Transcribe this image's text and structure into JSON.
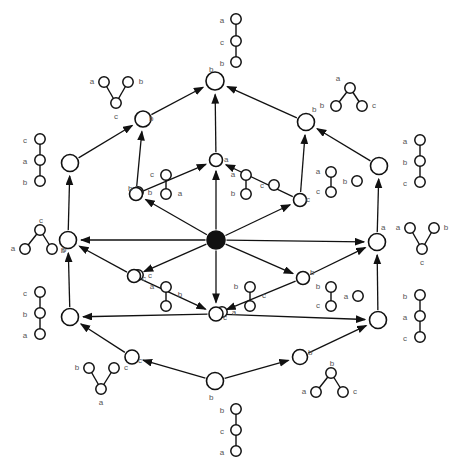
{
  "diagram": {
    "type": "lattice-diagram",
    "node_color": "#ffffff",
    "node_stroke": "#111111",
    "bottom_node_color": "#111111",
    "edge_color": "#111111",
    "label_color": "#555555",
    "labels": {
      "a": "a",
      "b": "b",
      "c": "c"
    },
    "lattice_nodes": [
      {
        "id": "top",
        "x": 215,
        "y": 81,
        "r": 9,
        "filled": false,
        "name": "lattice-node-top"
      },
      {
        "id": "ul",
        "x": 143,
        "y": 119,
        "r": 8,
        "filled": false,
        "name": "lattice-node-upper-left"
      },
      {
        "id": "ur",
        "x": 306,
        "y": 122,
        "r": 8.5,
        "filled": false,
        "name": "lattice-node-upper-right"
      },
      {
        "id": "l1",
        "x": 70,
        "y": 163,
        "r": 8.5,
        "filled": false,
        "name": "lattice-node-left-upper"
      },
      {
        "id": "m1",
        "x": 216,
        "y": 160,
        "r": 6.5,
        "filled": false,
        "name": "lattice-node-inner-top"
      },
      {
        "id": "r1",
        "x": 379,
        "y": 166,
        "r": 8.5,
        "filled": false,
        "name": "lattice-node-right-upper"
      },
      {
        "id": "im_l",
        "x": 136,
        "y": 194,
        "r": 6.5,
        "filled": false,
        "name": "lattice-node-inner-upper-left"
      },
      {
        "id": "im_r",
        "x": 300,
        "y": 200,
        "r": 6.5,
        "filled": false,
        "name": "lattice-node-inner-upper-right"
      },
      {
        "id": "l2",
        "x": 68,
        "y": 240,
        "r": 8.5,
        "filled": false,
        "name": "lattice-node-left-lower"
      },
      {
        "id": "center",
        "x": 216,
        "y": 240,
        "r": 9,
        "filled": true,
        "name": "lattice-node-center"
      },
      {
        "id": "r2",
        "x": 377,
        "y": 242,
        "r": 8.5,
        "filled": false,
        "name": "lattice-node-right-lower"
      },
      {
        "id": "im_l2",
        "x": 134,
        "y": 276,
        "r": 6.5,
        "filled": false,
        "name": "lattice-node-inner-lower-left"
      },
      {
        "id": "im_r2",
        "x": 303,
        "y": 278,
        "r": 6.5,
        "filled": false,
        "name": "lattice-node-inner-lower-right"
      },
      {
        "id": "l3",
        "x": 70,
        "y": 317,
        "r": 8.5,
        "filled": false,
        "name": "lattice-node-left-bottom"
      },
      {
        "id": "m2",
        "x": 216,
        "y": 314,
        "r": 7,
        "filled": false,
        "name": "lattice-node-inner-bottom"
      },
      {
        "id": "r3",
        "x": 378,
        "y": 320,
        "r": 8.5,
        "filled": false,
        "name": "lattice-node-right-bottom"
      },
      {
        "id": "bl",
        "x": 132,
        "y": 357,
        "r": 7,
        "filled": false,
        "name": "lattice-node-lower-left"
      },
      {
        "id": "br",
        "x": 300,
        "y": 357,
        "r": 7.5,
        "filled": false,
        "name": "lattice-node-lower-right"
      },
      {
        "id": "bottom",
        "x": 215,
        "y": 381,
        "r": 8.5,
        "filled": false,
        "name": "lattice-node-bottom"
      }
    ],
    "lattice_edges": [
      {
        "from": "ul",
        "to": "top",
        "name": "edge-ul-top"
      },
      {
        "from": "ur",
        "to": "top",
        "name": "edge-ur-top"
      },
      {
        "from": "m1",
        "to": "top",
        "name": "edge-m1-top"
      },
      {
        "from": "l1",
        "to": "ul",
        "name": "edge-l1-ul"
      },
      {
        "from": "im_l",
        "to": "ul",
        "name": "edge-iml-ul"
      },
      {
        "from": "r1",
        "to": "ur",
        "name": "edge-r1-ur"
      },
      {
        "from": "im_r",
        "to": "ur",
        "name": "edge-imr-ur"
      },
      {
        "from": "l2",
        "to": "l1",
        "name": "edge-l2-l1"
      },
      {
        "from": "im_l",
        "to": "m1",
        "name": "edge-iml-m1"
      },
      {
        "from": "im_r",
        "to": "m1",
        "name": "edge-imr-m1"
      },
      {
        "from": "r2",
        "to": "r1",
        "name": "edge-r2-r1"
      },
      {
        "from": "center",
        "to": "m1",
        "name": "edge-center-m1"
      },
      {
        "from": "center",
        "to": "im_l",
        "name": "edge-center-iml"
      },
      {
        "from": "center",
        "to": "im_r",
        "name": "edge-center-imr"
      },
      {
        "from": "center",
        "to": "l2",
        "name": "edge-center-l2"
      },
      {
        "from": "center",
        "to": "r2",
        "name": "edge-center-r2"
      },
      {
        "from": "center",
        "to": "im_l2",
        "name": "edge-center-iml2"
      },
      {
        "from": "center",
        "to": "im_r2",
        "name": "edge-center-imr2"
      },
      {
        "from": "center",
        "to": "m2",
        "name": "edge-center-m2"
      },
      {
        "from": "im_l2",
        "to": "l2",
        "name": "edge-iml2-l2"
      },
      {
        "from": "im_r2",
        "to": "r2",
        "name": "edge-imr2-r2"
      },
      {
        "from": "l3",
        "to": "l2",
        "name": "edge-l3-l2"
      },
      {
        "from": "r3",
        "to": "r2",
        "name": "edge-r3-r2"
      },
      {
        "from": "im_l2",
        "to": "m2",
        "name": "edge-iml2-m2"
      },
      {
        "from": "im_r2",
        "to": "m2",
        "name": "edge-imr2-m2"
      },
      {
        "from": "m2",
        "to": "l3",
        "name": "edge-m2-l3"
      },
      {
        "from": "m2",
        "to": "r3",
        "name": "edge-m2-r3"
      },
      {
        "from": "bl",
        "to": "l3",
        "name": "edge-bl-l3"
      },
      {
        "from": "br",
        "to": "r3",
        "name": "edge-br-r3"
      },
      {
        "from": "bottom",
        "to": "bl",
        "name": "edge-bottom-bl"
      },
      {
        "from": "bottom",
        "to": "br",
        "name": "edge-bottom-br"
      }
    ],
    "node_tags": [
      {
        "text": "b",
        "x": 209,
        "y": 72,
        "name": "node-tag-top"
      },
      {
        "text": "b",
        "x": 149,
        "y": 121,
        "name": "node-tag-ul"
      },
      {
        "text": "b",
        "x": 312,
        "y": 112,
        "name": "node-tag-ur"
      },
      {
        "text": "a",
        "x": 224,
        "y": 162,
        "name": "node-tag-m1"
      },
      {
        "text": "b",
        "x": 128,
        "y": 191,
        "name": "node-tag-iml"
      },
      {
        "text": "c",
        "x": 306,
        "y": 202,
        "name": "node-tag-imr"
      },
      {
        "text": "b",
        "x": 62,
        "y": 252,
        "name": "node-tag-l2"
      },
      {
        "text": "a",
        "x": 381,
        "y": 230,
        "name": "node-tag-r2"
      },
      {
        "text": "c",
        "x": 142,
        "y": 281,
        "name": "node-tag-iml2"
      },
      {
        "text": "b",
        "x": 310,
        "y": 275,
        "name": "node-tag-imr2"
      },
      {
        "text": "c",
        "x": 223,
        "y": 320,
        "name": "node-tag-m2"
      },
      {
        "text": "c",
        "x": 138,
        "y": 363,
        "name": "node-tag-bl"
      },
      {
        "text": "b",
        "x": 308,
        "y": 355,
        "name": "node-tag-br"
      },
      {
        "text": "b",
        "x": 209,
        "y": 400,
        "name": "node-tag-bottom"
      }
    ],
    "posets": [
      {
        "name": "poset-top-chain",
        "shape": "chain",
        "nodes": [
          {
            "label": "a",
            "x": 236,
            "y": 19,
            "lx": 222,
            "ly": 20
          },
          {
            "label": "c",
            "x": 236,
            "y": 41,
            "lx": 222,
            "ly": 42
          },
          {
            "label": "b",
            "x": 236,
            "y": 62,
            "lx": 222,
            "ly": 63
          }
        ],
        "links": [
          [
            0,
            1
          ],
          [
            1,
            2
          ]
        ]
      },
      {
        "name": "poset-upper-left-v",
        "shape": "v-up",
        "nodes": [
          {
            "label": "a",
            "x": 104,
            "y": 82,
            "lx": 92,
            "ly": 81
          },
          {
            "label": "b",
            "x": 128,
            "y": 82,
            "lx": 141,
            "ly": 81
          },
          {
            "label": "c",
            "x": 116,
            "y": 103,
            "lx": 116,
            "ly": 116
          }
        ],
        "links": [
          [
            0,
            2
          ],
          [
            1,
            2
          ]
        ]
      },
      {
        "name": "poset-upper-right-v",
        "shape": "v-down",
        "nodes": [
          {
            "label": "a",
            "x": 350,
            "y": 88,
            "lx": 338,
            "ly": 78
          },
          {
            "label": "b",
            "x": 336,
            "y": 106,
            "lx": 322,
            "ly": 105
          },
          {
            "label": "c",
            "x": 362,
            "y": 106,
            "lx": 374,
            "ly": 105
          }
        ],
        "links": [
          [
            0,
            1
          ],
          [
            0,
            2
          ]
        ]
      },
      {
        "name": "poset-left-upper-chain",
        "shape": "chain",
        "nodes": [
          {
            "label": "c",
            "x": 40,
            "y": 139,
            "lx": 25,
            "ly": 140
          },
          {
            "label": "a",
            "x": 40,
            "y": 160,
            "lx": 25,
            "ly": 161
          },
          {
            "label": "b",
            "x": 40,
            "y": 181,
            "lx": 25,
            "ly": 182
          }
        ],
        "links": [
          [
            0,
            1
          ],
          [
            1,
            2
          ]
        ]
      },
      {
        "name": "poset-right-upper-chain",
        "shape": "chain",
        "nodes": [
          {
            "label": "a",
            "x": 420,
            "y": 140,
            "lx": 405,
            "ly": 141
          },
          {
            "label": "b",
            "x": 420,
            "y": 161,
            "lx": 405,
            "ly": 162
          },
          {
            "label": "c",
            "x": 420,
            "y": 182,
            "lx": 405,
            "ly": 183
          }
        ],
        "links": [
          [
            0,
            1
          ],
          [
            1,
            2
          ]
        ]
      },
      {
        "name": "poset-inner-top-left-pair",
        "shape": "pair-plus-single",
        "nodes": [
          {
            "label": "c",
            "x": 166,
            "y": 175,
            "lx": 152,
            "ly": 174
          },
          {
            "label": "a",
            "x": 166,
            "y": 194,
            "lx": 180,
            "ly": 193
          },
          {
            "label": "b",
            "x": 166,
            "y": 178,
            "lx": 150,
            "ly": 192
          }
        ],
        "links": [
          [
            0,
            1
          ]
        ]
      },
      {
        "name": "poset-inner-top-right-pair",
        "shape": "pair-plus-single",
        "nodes": [
          {
            "label": "a",
            "x": 246,
            "y": 175,
            "lx": 233,
            "ly": 174
          },
          {
            "label": "b",
            "x": 246,
            "y": 194,
            "lx": 233,
            "ly": 193
          },
          {
            "label": "c",
            "x": 246,
            "y": 178,
            "lx": 262,
            "ly": 185
          }
        ],
        "links": [
          [
            0,
            1
          ]
        ]
      },
      {
        "name": "poset-inner-right-pair",
        "shape": "pair-plus-single",
        "nodes": [
          {
            "label": "a",
            "x": 331,
            "y": 172,
            "lx": 318,
            "ly": 171
          },
          {
            "label": "c",
            "x": 331,
            "y": 192,
            "lx": 318,
            "ly": 191
          },
          {
            "label": "b",
            "x": 331,
            "y": 176,
            "lx": 345,
            "ly": 181
          }
        ],
        "links": [
          [
            0,
            1
          ]
        ]
      },
      {
        "name": "poset-left-v",
        "shape": "v-down",
        "nodes": [
          {
            "label": "c",
            "x": 40,
            "y": 230,
            "lx": 41,
            "ly": 220
          },
          {
            "label": "a",
            "x": 25,
            "y": 249,
            "lx": 13,
            "ly": 248
          },
          {
            "label": "b",
            "x": 52,
            "y": 249,
            "lx": 63,
            "ly": 250
          }
        ],
        "links": [
          [
            0,
            1
          ],
          [
            0,
            2
          ]
        ]
      },
      {
        "name": "poset-right-v",
        "shape": "v-up",
        "nodes": [
          {
            "label": "a",
            "x": 410,
            "y": 228,
            "lx": 398,
            "ly": 227
          },
          {
            "label": "b",
            "x": 434,
            "y": 228,
            "lx": 446,
            "ly": 227
          },
          {
            "label": "c",
            "x": 422,
            "y": 249,
            "lx": 422,
            "ly": 262
          }
        ],
        "links": [
          [
            0,
            2
          ],
          [
            1,
            2
          ]
        ]
      },
      {
        "name": "poset-inner-bottom-left-pair",
        "shape": "pair-plus-single",
        "nodes": [
          {
            "label": "a",
            "x": 166,
            "y": 287,
            "lx": 152,
            "ly": 286
          },
          {
            "label": "b",
            "x": 166,
            "y": 306,
            "lx": 180,
            "ly": 294
          },
          {
            "label": "c",
            "x": 166,
            "y": 291,
            "lx": 150,
            "ly": 275
          }
        ],
        "links": [
          [
            0,
            1
          ]
        ]
      },
      {
        "name": "poset-inner-bottom-mid-pair",
        "shape": "pair-plus-single",
        "nodes": [
          {
            "label": "b",
            "x": 250,
            "y": 287,
            "lx": 236,
            "ly": 286
          },
          {
            "label": "c",
            "x": 250,
            "y": 306,
            "lx": 264,
            "ly": 295
          },
          {
            "label": "a",
            "x": 250,
            "y": 291,
            "lx": 234,
            "ly": 312
          }
        ],
        "links": [
          [
            0,
            1
          ]
        ]
      },
      {
        "name": "poset-inner-bottom-right-pair",
        "shape": "pair-plus-single",
        "nodes": [
          {
            "label": "b",
            "x": 331,
            "y": 287,
            "lx": 318,
            "ly": 286
          },
          {
            "label": "c",
            "x": 331,
            "y": 306,
            "lx": 318,
            "ly": 305
          },
          {
            "label": "a",
            "x": 331,
            "y": 291,
            "lx": 346,
            "ly": 296
          }
        ],
        "links": [
          [
            0,
            1
          ]
        ]
      },
      {
        "name": "poset-left-bottom-chain",
        "shape": "chain",
        "nodes": [
          {
            "label": "c",
            "x": 40,
            "y": 292,
            "lx": 25,
            "ly": 293
          },
          {
            "label": "b",
            "x": 40,
            "y": 313,
            "lx": 25,
            "ly": 314
          },
          {
            "label": "a",
            "x": 40,
            "y": 334,
            "lx": 25,
            "ly": 335
          }
        ],
        "links": [
          [
            0,
            1
          ],
          [
            1,
            2
          ]
        ]
      },
      {
        "name": "poset-right-bottom-chain",
        "shape": "chain",
        "nodes": [
          {
            "label": "b",
            "x": 420,
            "y": 295,
            "lx": 405,
            "ly": 296
          },
          {
            "label": "a",
            "x": 420,
            "y": 316,
            "lx": 405,
            "ly": 317
          },
          {
            "label": "c",
            "x": 420,
            "y": 337,
            "lx": 405,
            "ly": 338
          }
        ],
        "links": [
          [
            0,
            1
          ],
          [
            1,
            2
          ]
        ]
      },
      {
        "name": "poset-lower-left-v",
        "shape": "v-up",
        "nodes": [
          {
            "label": "b",
            "x": 89,
            "y": 368,
            "lx": 77,
            "ly": 367
          },
          {
            "label": "c",
            "x": 114,
            "y": 368,
            "lx": 126,
            "ly": 367
          },
          {
            "label": "a",
            "x": 101,
            "y": 389,
            "lx": 101,
            "ly": 402
          }
        ],
        "links": [
          [
            0,
            2
          ],
          [
            1,
            2
          ]
        ]
      },
      {
        "name": "poset-lower-right-v",
        "shape": "v-down",
        "nodes": [
          {
            "label": "b",
            "x": 331,
            "y": 373,
            "lx": 332,
            "ly": 363
          },
          {
            "label": "a",
            "x": 316,
            "y": 392,
            "lx": 304,
            "ly": 391
          },
          {
            "label": "c",
            "x": 343,
            "y": 392,
            "lx": 355,
            "ly": 391
          }
        ],
        "links": [
          [
            0,
            1
          ],
          [
            0,
            2
          ]
        ]
      },
      {
        "name": "poset-bottom-chain",
        "shape": "chain",
        "nodes": [
          {
            "label": "b",
            "x": 236,
            "y": 409,
            "lx": 222,
            "ly": 410
          },
          {
            "label": "c",
            "x": 236,
            "y": 430,
            "lx": 222,
            "ly": 431
          },
          {
            "label": "a",
            "x": 236,
            "y": 451,
            "lx": 222,
            "ly": 452
          }
        ],
        "links": [
          [
            0,
            1
          ],
          [
            1,
            2
          ]
        ]
      }
    ]
  }
}
